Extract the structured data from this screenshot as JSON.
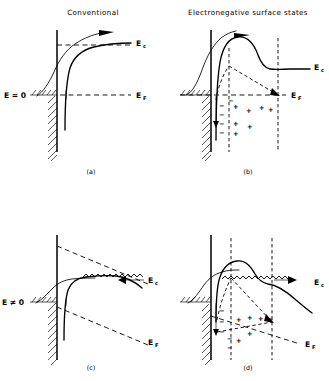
{
  "figure": {
    "kind": "semiconductor-band-diagram-2x2",
    "column_titles": {
      "left": "Conventional",
      "right": "Electronegative surface states"
    },
    "panels": [
      {
        "id": "a",
        "caption": "(a)",
        "field_label": "E = 0",
        "band_label": "E",
        "band_sub": "c",
        "fermi_label": "E",
        "fermi_sub": "F",
        "has_surface_states": false,
        "has_field": false
      },
      {
        "id": "b",
        "caption": "(b)",
        "field_label": "",
        "band_label": "E",
        "band_sub": "c",
        "fermi_label": "E",
        "fermi_sub": "F",
        "has_surface_states": true,
        "has_field": false,
        "negative_charges": [
          "−",
          "−",
          "−",
          "−",
          "−"
        ],
        "positive_charges": [
          "+",
          "+",
          "+",
          "+",
          "+",
          "+",
          "+"
        ]
      },
      {
        "id": "c",
        "caption": "(c)",
        "field_label": "E ≠ 0",
        "band_label": "E",
        "band_sub": "c",
        "fermi_label": "E",
        "fermi_sub": "F",
        "has_surface_states": false,
        "has_field": true
      },
      {
        "id": "d",
        "caption": "(d)",
        "field_label": "",
        "band_label": "E",
        "band_sub": "c",
        "fermi_label": "E",
        "fermi_sub": "F",
        "has_surface_states": true,
        "has_field": true,
        "negative_charges": [
          "−",
          "−",
          "−",
          "−",
          "−"
        ],
        "positive_charges": [
          "+",
          "+",
          "+",
          "+",
          "+",
          "+"
        ]
      }
    ],
    "colors": {
      "ink": "#000000",
      "background": "#ffffff"
    }
  }
}
